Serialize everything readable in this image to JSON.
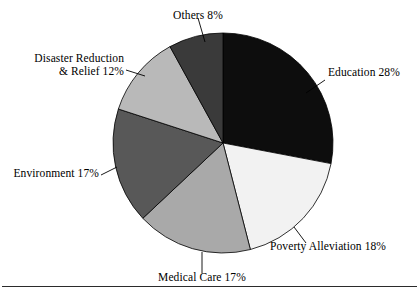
{
  "figure": {
    "name": "charitable-spending-pie-chart",
    "background_color": "#ffffff",
    "has_bottom_rule": true
  },
  "chart_data": {
    "type": "pie",
    "title": "",
    "subtitle": "",
    "xlabel": "",
    "ylabel": "",
    "legend_position": "none",
    "label_style": "external-with-leader-lines",
    "start_angle_deg": 0,
    "direction": "clockwise",
    "units": "percent",
    "categories": [
      "Education",
      "Poverty Alleviation",
      "Medical Care",
      "Environment",
      "Disaster Reduction & Relief",
      "Others"
    ],
    "values": [
      28,
      18,
      17,
      17,
      12,
      8
    ],
    "total": 100,
    "slices": [
      {
        "label": "Education",
        "value": 28,
        "value_text": "28%",
        "full_label": "Education 28%",
        "color": "#0d0d0d",
        "label_lines": [
          "Education 28%"
        ],
        "label_align": "left"
      },
      {
        "label": "Poverty Alleviation",
        "value": 18,
        "value_text": "18%",
        "full_label": "Poverty Alleviation 18%",
        "color": "#f2f2f2",
        "label_lines": [
          "Poverty Alleviation 18%"
        ],
        "label_align": "left"
      },
      {
        "label": "Medical Care",
        "value": 17,
        "value_text": "17%",
        "full_label": "Medical Care 17%",
        "color": "#a9a9a9",
        "label_lines": [
          "Medical Care 17%"
        ],
        "label_align": "center"
      },
      {
        "label": "Environment",
        "value": 17,
        "value_text": "17%",
        "full_label": "Environment 17%",
        "color": "#585858",
        "label_lines": [
          "Environment 17%"
        ],
        "label_align": "right"
      },
      {
        "label": "Disaster Reduction & Relief",
        "value": 12,
        "value_text": "12%",
        "full_label": "Disaster Reduction & Relief 12%",
        "color": "#b9b9b9",
        "label_lines": [
          "Disaster Reduction",
          "& Relief 12%"
        ],
        "label_align": "right"
      },
      {
        "label": "Others",
        "value": 8,
        "value_text": "8%",
        "full_label": "Others 8%",
        "color": "#3a3a3a",
        "label_lines": [
          "Others 8%"
        ],
        "label_align": "center"
      }
    ]
  },
  "geometry": {
    "center_x": 223,
    "center_y": 143,
    "radius": 110
  }
}
